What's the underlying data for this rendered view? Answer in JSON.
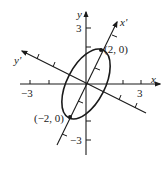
{
  "diagram": {
    "type": "rotated-ellipse",
    "axes": {
      "x_label": "x",
      "y_label": "y",
      "x_prime_label": "x'",
      "y_prime_label": "y'"
    },
    "tick_labels": {
      "x_neg": "−3",
      "x_pos": "3",
      "y_pos": "3",
      "y_neg": "−3"
    },
    "points": [
      {
        "label": "(2, 0)"
      },
      {
        "label": "(−2, 0)"
      }
    ],
    "colors": {
      "stroke": "#1a1a1a",
      "background": "#ffffff"
    }
  }
}
